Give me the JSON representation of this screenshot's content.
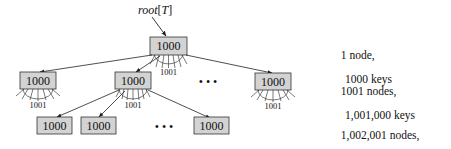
{
  "diagram": {
    "root_label": "root[T]",
    "root_label_parts": {
      "name": "root",
      "open": "[",
      "arg": "T",
      "close": "]"
    },
    "node_keys": "1000",
    "children_count_label": "1001",
    "ellipsis": "• • •",
    "levels": [
      {
        "depth": 0,
        "nodes": 1,
        "line1": "1 node,",
        "line2": "1000 keys"
      },
      {
        "depth": 1,
        "nodes": 1001,
        "line1": "1001 nodes,",
        "line2": "1,001,000 keys"
      },
      {
        "depth": 2,
        "nodes": 1002001,
        "line1": "1,002,001 nodes,",
        "line2": "1,002,001,000 keys"
      }
    ],
    "colors": {
      "node_fill": "#d3d3d3",
      "node_stroke": "#333333",
      "edge": "#222222"
    }
  }
}
